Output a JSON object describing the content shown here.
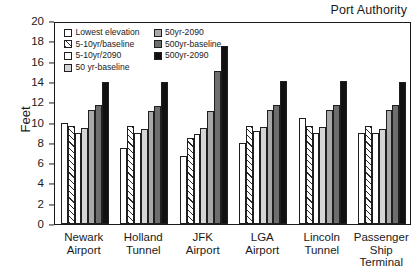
{
  "chart": {
    "title": "Port Authority",
    "ylabel": "Feet"
  },
  "legend": {
    "columns": [
      {
        "entries": [
          {
            "label": "Lowest elevation",
            "key": "lowest"
          },
          {
            "label": "5-10yr/baseline",
            "key": "p510base"
          },
          {
            "label": "5-10yr/2090",
            "key": "p5102090"
          },
          {
            "label": "50 yr-baseline",
            "key": "p50base"
          }
        ]
      },
      {
        "entries": [
          {
            "label": "50yr-2090",
            "key": "p502090"
          },
          {
            "label": "500yr-baseline",
            "key": "p500base"
          },
          {
            "label": "500yr-2090",
            "key": "p5002090"
          }
        ]
      }
    ]
  },
  "chart_data": {
    "type": "bar",
    "title": "Port Authority",
    "xlabel": "",
    "ylabel": "Feet",
    "ylim": [
      0,
      20
    ],
    "yticks": [
      0,
      2,
      4,
      6,
      8,
      10,
      12,
      14,
      16,
      18,
      20
    ],
    "grid": false,
    "legend_position": "top-left-inside",
    "categories": [
      "Newark\nAirport",
      "Holland\nTunnel",
      "JFK\nAirport",
      "LGA\nAirport",
      "Lincoln\nTunnel",
      "Passenger\nShip Terminal"
    ],
    "series": [
      {
        "name": "Lowest elevation",
        "key": "lowest",
        "color": "#ffffff",
        "pattern": "solid",
        "values": [
          10.0,
          7.5,
          6.7,
          8.0,
          10.4,
          9.0
        ]
      },
      {
        "name": "5-10yr/baseline",
        "key": "p510base",
        "color": "#ffffff",
        "pattern": "hatch",
        "values": [
          9.7,
          9.7,
          8.5,
          9.7,
          9.7,
          9.7
        ]
      },
      {
        "name": "5-10yr/2090",
        "key": "p5102090",
        "color": "#ffffff",
        "pattern": "solid",
        "values": [
          9.0,
          9.0,
          8.9,
          9.2,
          9.0,
          9.0
        ]
      },
      {
        "name": "50 yr-baseline",
        "key": "p50base",
        "color": "#d5d5d5",
        "pattern": "solid",
        "values": [
          9.5,
          9.4,
          9.5,
          9.6,
          9.6,
          9.4
        ]
      },
      {
        "name": "50yr-2090",
        "key": "p502090",
        "color": "#a8a8a8",
        "pattern": "solid",
        "values": [
          11.2,
          11.1,
          11.1,
          11.2,
          11.2,
          11.2
        ]
      },
      {
        "name": "500yr-baseline",
        "key": "p500base",
        "color": "#6e6e6e",
        "pattern": "solid",
        "values": [
          11.7,
          11.6,
          15.1,
          11.7,
          11.7,
          11.7
        ]
      },
      {
        "name": "500yr-2090",
        "key": "p5002090",
        "color": "#111111",
        "pattern": "solid",
        "values": [
          14.0,
          14.0,
          17.5,
          14.1,
          14.1,
          14.0
        ]
      }
    ]
  }
}
